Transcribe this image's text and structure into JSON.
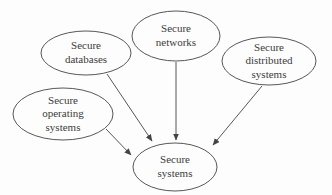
{
  "diagram": {
    "background": "#fdfdfd",
    "stroke_color": "#444444",
    "text_color": "#3c3c3c",
    "nodes": [
      {
        "id": "secure-databases",
        "label": "Secure databases",
        "lines": [
          "Secure",
          "databases"
        ],
        "cx": 86,
        "cy": 53,
        "rx": 45,
        "ry": 22
      },
      {
        "id": "secure-networks",
        "label": "Secure networks",
        "lines": [
          "Secure",
          "networks"
        ],
        "cx": 176,
        "cy": 36,
        "rx": 44,
        "ry": 25
      },
      {
        "id": "secure-distributed-systems",
        "label": "Secure distributed systems",
        "lines": [
          "Secure",
          "distributed",
          "systems"
        ],
        "cx": 269,
        "cy": 61,
        "rx": 47,
        "ry": 24
      },
      {
        "id": "secure-operating-systems",
        "label": "Secure operating systems",
        "lines": [
          "Secure",
          "operating",
          "systems"
        ],
        "cx": 63,
        "cy": 114,
        "rx": 50,
        "ry": 26
      },
      {
        "id": "secure-systems",
        "label": "Secure systems",
        "lines": [
          "Secure",
          "systems"
        ],
        "cx": 175,
        "cy": 167,
        "rx": 42,
        "ry": 24
      }
    ],
    "edges": [
      {
        "from": "secure-databases",
        "to": "secure-systems",
        "x1": 107,
        "y1": 74,
        "x2": 152,
        "y2": 141
      },
      {
        "from": "secure-networks",
        "to": "secure-systems",
        "x1": 176,
        "y1": 62,
        "x2": 176,
        "y2": 140
      },
      {
        "from": "secure-distributed-systems",
        "to": "secure-systems",
        "x1": 262,
        "y1": 86,
        "x2": 213,
        "y2": 145
      },
      {
        "from": "secure-operating-systems",
        "to": "secure-systems",
        "x1": 106,
        "y1": 129,
        "x2": 131,
        "y2": 155
      }
    ]
  }
}
